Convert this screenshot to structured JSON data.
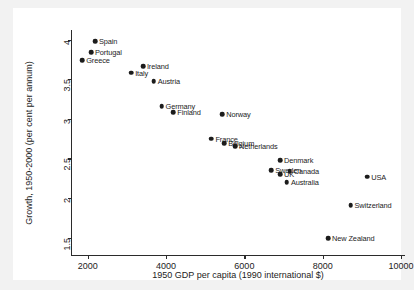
{
  "chart_data": {
    "type": "scatter",
    "title": "",
    "xlabel": "1950 GDP per capita (1990 international $)",
    "ylabel": "Growth, 1950-2000 (per cent per annum)",
    "xlim": [
      1600,
      10100
    ],
    "ylim": [
      1.28,
      4.12
    ],
    "xticks": [
      2000,
      4000,
      6000,
      8000,
      10000
    ],
    "xtick_labels": [
      "2000",
      "4000",
      "6000",
      "8000",
      "10000"
    ],
    "yticks": [
      1.5,
      2,
      2.5,
      3,
      3.5,
      4
    ],
    "ytick_labels": [
      "1.5",
      "2",
      "2.5",
      "3",
      "3.5",
      "4"
    ],
    "grid": false,
    "legend": "none",
    "marker": "filled-circle",
    "marker_color": "#1c1c1c",
    "points": [
      {
        "label": "Spain",
        "x": 2185,
        "y": 3.98,
        "label_pos": "right"
      },
      {
        "label": "Portugal",
        "x": 2085,
        "y": 3.84,
        "label_pos": "right"
      },
      {
        "label": "Greece",
        "x": 1860,
        "y": 3.74,
        "label_pos": "right"
      },
      {
        "label": "Ireland",
        "x": 3410,
        "y": 3.66,
        "label_pos": "right"
      },
      {
        "label": "Italy",
        "x": 3110,
        "y": 3.58,
        "label_pos": "right"
      },
      {
        "label": "Austria",
        "x": 3685,
        "y": 3.47,
        "label_pos": "right"
      },
      {
        "label": "Germany",
        "x": 3885,
        "y": 3.16,
        "label_pos": "right"
      },
      {
        "label": "Finland",
        "x": 4185,
        "y": 3.08,
        "label_pos": "right"
      },
      {
        "label": "Norway",
        "x": 5435,
        "y": 3.06,
        "label_pos": "right"
      },
      {
        "label": "France",
        "x": 5160,
        "y": 2.75,
        "label_pos": "right"
      },
      {
        "label": "Belgium",
        "x": 5485,
        "y": 2.69,
        "label_pos": "right"
      },
      {
        "label": "Netherlands",
        "x": 5760,
        "y": 2.65,
        "label_pos": "right"
      },
      {
        "label": "Denmark",
        "x": 6910,
        "y": 2.48,
        "label_pos": "right"
      },
      {
        "label": "Sweden",
        "x": 6685,
        "y": 2.35,
        "label_pos": "right"
      },
      {
        "label": "Canada",
        "x": 7160,
        "y": 2.34,
        "label_pos": "right"
      },
      {
        "label": "UK",
        "x": 6910,
        "y": 2.3,
        "label_pos": "right"
      },
      {
        "label": "Australia",
        "x": 7085,
        "y": 2.2,
        "label_pos": "right"
      },
      {
        "label": "USA",
        "x": 9135,
        "y": 2.27,
        "label_pos": "right"
      },
      {
        "label": "Switzerland",
        "x": 8710,
        "y": 1.91,
        "label_pos": "right"
      },
      {
        "label": "New Zealand",
        "x": 8135,
        "y": 1.49,
        "label_pos": "right"
      }
    ]
  }
}
